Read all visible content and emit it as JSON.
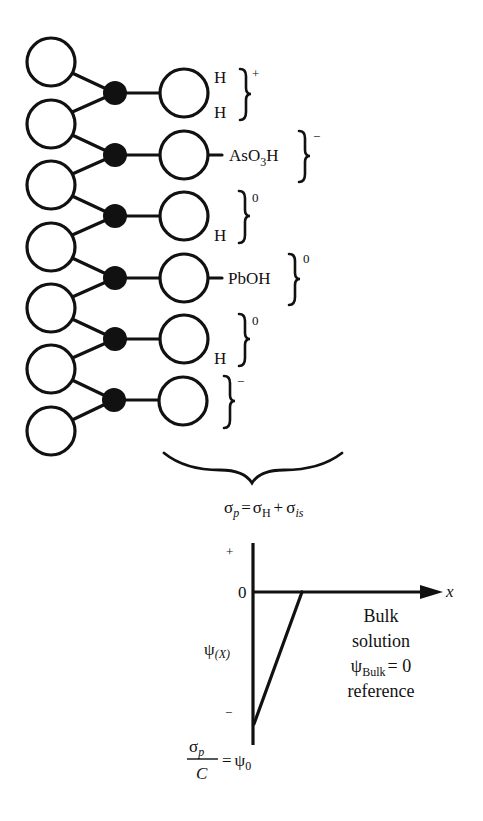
{
  "figure": {
    "type": "surface-charge-schematic",
    "colors": {
      "stroke": "#111111",
      "background": "#ffffff",
      "node_fill": "#111111"
    }
  },
  "surface_structure": {
    "left_circles_count": 7,
    "filled_nodes_count": 6,
    "right_circles_count": 6,
    "groups": [
      {
        "id": "g1",
        "ligands": [
          "H",
          "H"
        ],
        "bond_label": "",
        "charge": "+"
      },
      {
        "id": "g2",
        "ligands": [],
        "bond_label": "AsO",
        "bond_label_sub": "3",
        "bond_label_tail": "H",
        "charge": "−"
      },
      {
        "id": "g3",
        "ligands": [
          "H"
        ],
        "bond_label": "",
        "charge": "0"
      },
      {
        "id": "g4",
        "ligands": [],
        "bond_label": "PbOH",
        "charge": "0"
      },
      {
        "id": "g5",
        "ligands": [
          "H"
        ],
        "bond_label": "",
        "charge": "0"
      },
      {
        "id": "g6",
        "ligands": [],
        "bond_label": "",
        "charge": "−"
      }
    ]
  },
  "equation": {
    "lhs_symbol": "σ",
    "lhs_sub": "p",
    "equals": "=",
    "term1_symbol": "σ",
    "term1_sub": "H",
    "plus": "+",
    "term2_symbol": "σ",
    "term2_sub": "is"
  },
  "potential_plot": {
    "y_axis_plus": "+",
    "y_axis_zero": "0",
    "y_axis_minus": "−",
    "y_axis_label_symbol": "ψ",
    "y_axis_label_arg": "(X)",
    "x_axis_label": "x",
    "bulk_lines": [
      "Bulk",
      "solution"
    ],
    "bulk_psi_symbol": "ψ",
    "bulk_psi_sub": "Bulk",
    "bulk_psi_value": "= 0",
    "bulk_reference": "reference",
    "surface_fraction_num_symbol": "σ",
    "surface_fraction_num_sub": "p",
    "surface_fraction_den": "C",
    "surface_equals": "=",
    "surface_psi_symbol": "ψ",
    "surface_psi_sub": "0"
  }
}
